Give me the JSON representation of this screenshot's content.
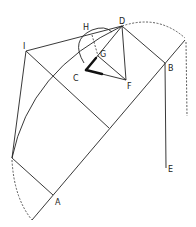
{
  "diagram": {
    "type": "geometric construction",
    "labels": {
      "A": "A",
      "B": "B",
      "C": "C",
      "D": "D",
      "E": "E",
      "F": "F",
      "G": "G",
      "H": "H",
      "I": "I"
    },
    "points": {
      "A": [
        53,
        195
      ],
      "B": [
        165,
        63
      ],
      "C": [
        86,
        70
      ],
      "D": [
        122,
        26
      ],
      "E": [
        166,
        168
      ],
      "F": [
        126,
        80
      ],
      "G": [
        98,
        56
      ],
      "H": [
        88,
        29
      ],
      "I": [
        26,
        51
      ]
    },
    "colors": {
      "line": "#222222",
      "background": "#ffffff"
    }
  }
}
